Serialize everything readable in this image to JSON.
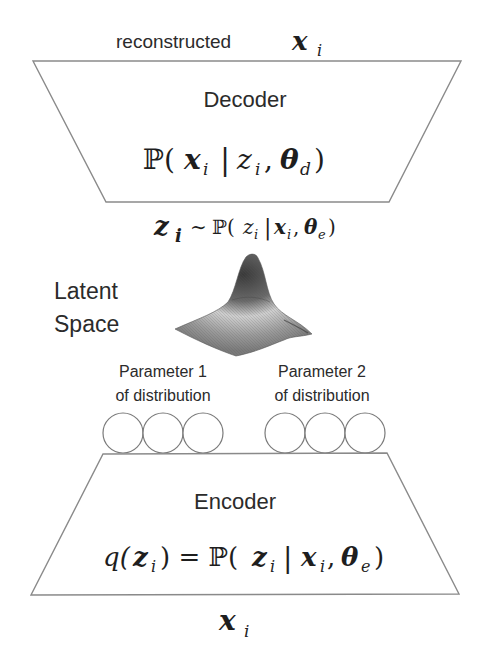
{
  "top_label": {
    "text": "reconstructed",
    "var": "x",
    "sub": "i"
  },
  "decoder": {
    "title": "Decoder",
    "formula": {
      "P": "ℙ(",
      "x": "x",
      "xi": "i",
      "bar": "|",
      "z": "z",
      "zi": "i",
      "comma": ",",
      "theta": "θ",
      "thsub": "d",
      "close": ")"
    }
  },
  "sample_label": {
    "z": "z",
    "zi": "i",
    "tilde": "∼",
    "P": "ℙ(",
    "z2": "z",
    "z2i": "i",
    "bar": "|",
    "x": "x",
    "xi": "i",
    "comma": ",",
    "theta": "θ",
    "thsub": "e",
    "close": ")"
  },
  "latent": {
    "line1": "Latent",
    "line2": "Space",
    "icon": "gaussian-surface-3d"
  },
  "params": [
    {
      "line1": "Parameter 1",
      "line2": "of distribution",
      "nodes": 3
    },
    {
      "line1": "Parameter 2",
      "line2": "of distribution",
      "nodes": 3
    }
  ],
  "encoder": {
    "title": "Encoder",
    "formula": {
      "q": "q(",
      "z": "z",
      "zi": "i",
      "eq": ") = ℙ(",
      "z2": "z",
      "z2i": "i",
      "bar": "|",
      "x": "x",
      "xi": "i",
      "comma": ",",
      "theta": "θ",
      "thsub": "e",
      "close": ")"
    }
  },
  "bottom_label": {
    "var": "x",
    "sub": "i"
  },
  "colors": {
    "stroke": "#8a8a8a",
    "text": "#2b2b2b",
    "background": "#ffffff"
  }
}
